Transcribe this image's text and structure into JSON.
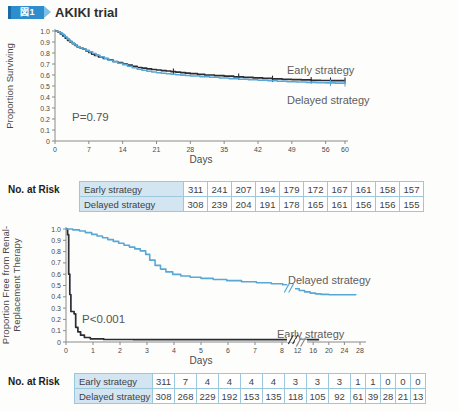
{
  "header": {
    "figure_badge": "図1",
    "title": "AKIKI trial"
  },
  "colors": {
    "badge_blue": "#2e8ecd",
    "badge_dark_blue": "#1a69a8",
    "badge_light_blue": "#7fc0e6",
    "early_line": "#2b2c34",
    "delayed_line": "#58a8d7",
    "table_border": "#6fb0d4",
    "table_header_bg": "#d2e5f0"
  },
  "risk_tables": [
    {
      "section_label": "No. at Risk",
      "rows": [
        {
          "name": "Early strategy",
          "values": [
            "311",
            "241",
            "207",
            "194",
            "179",
            "172",
            "167",
            "161",
            "158",
            "157"
          ]
        },
        {
          "name": "Delayed strategy",
          "values": [
            "308",
            "239",
            "204",
            "191",
            "178",
            "165",
            "161",
            "156",
            "156",
            "155"
          ]
        }
      ]
    },
    {
      "section_label": "No. at Risk",
      "rows": [
        {
          "name": "Early strategy",
          "values": [
            "311",
            "7",
            "4",
            "4",
            "4",
            "4",
            "3",
            "3",
            "3",
            "1",
            "1",
            "0",
            "0",
            "0"
          ]
        },
        {
          "name": "Delayed strategy",
          "values": [
            "308",
            "268",
            "229",
            "192",
            "153",
            "135",
            "118",
            "105",
            "92",
            "61",
            "39",
            "28",
            "21",
            "13"
          ]
        }
      ]
    }
  ],
  "chart_data": [
    {
      "type": "line",
      "subtype": "kaplan-meier",
      "title": "",
      "ylabel": "Proportion Surviving",
      "xlabel": "Days",
      "annotation": "P=0.79",
      "xlim": [
        0,
        60
      ],
      "ylim": [
        0,
        1
      ],
      "grid": false,
      "x_ticks": [
        {
          "label": "0",
          "day": 0
        },
        {
          "label": "7",
          "day": 7
        },
        {
          "label": "14",
          "day": 14
        },
        {
          "label": "21",
          "day": 21
        },
        {
          "label": "28",
          "day": 28
        },
        {
          "label": "35",
          "day": 35
        },
        {
          "label": "42",
          "day": 42
        },
        {
          "label": "49",
          "day": 49
        },
        {
          "label": "56",
          "day": 56
        },
        {
          "label": "60",
          "day": 60
        }
      ],
      "y_ticks": [
        {
          "label": "1.0",
          "value": 1.0
        },
        {
          "label": "0.9",
          "value": 0.9
        },
        {
          "label": "0.8",
          "value": 0.8
        },
        {
          "label": "0.7",
          "value": 0.7
        },
        {
          "label": "0.6",
          "value": 0.6
        },
        {
          "label": "0.5",
          "value": 0.5
        },
        {
          "label": "0.4",
          "value": 0.4
        },
        {
          "label": "0.3",
          "value": 0.3
        },
        {
          "label": "0.2",
          "value": 0.2
        },
        {
          "label": "0.1",
          "value": 0.1
        },
        {
          "label": "0",
          "value": 0
        }
      ],
      "series": [
        {
          "name": "Early strategy",
          "color": "#2b2c34",
          "censor_days": [
            24.5,
            38,
            45,
            53,
            57,
            60
          ],
          "points": [
            [
              0,
              1.0
            ],
            [
              0.6,
              0.99
            ],
            [
              1.1,
              0.975
            ],
            [
              1.6,
              0.955
            ],
            [
              2.1,
              0.935
            ],
            [
              2.6,
              0.915
            ],
            [
              3.1,
              0.9
            ],
            [
              3.6,
              0.885
            ],
            [
              4.1,
              0.87
            ],
            [
              4.6,
              0.855
            ],
            [
              5.2,
              0.845
            ],
            [
              5.8,
              0.835
            ],
            [
              6.4,
              0.82
            ],
            [
              7,
              0.805
            ],
            [
              7.6,
              0.79
            ],
            [
              8.2,
              0.778
            ],
            [
              9,
              0.765
            ],
            [
              10,
              0.75
            ],
            [
              11,
              0.737
            ],
            [
              12,
              0.723
            ],
            [
              13,
              0.712
            ],
            [
              14,
              0.7
            ],
            [
              15,
              0.69
            ],
            [
              16,
              0.678
            ],
            [
              17,
              0.668
            ],
            [
              18,
              0.662
            ],
            [
              19,
              0.656
            ],
            [
              20,
              0.65
            ],
            [
              21,
              0.645
            ],
            [
              22,
              0.64
            ],
            [
              23,
              0.636
            ],
            [
              24,
              0.631
            ],
            [
              25,
              0.626
            ],
            [
              26,
              0.621
            ],
            [
              27,
              0.616
            ],
            [
              28,
              0.612
            ],
            [
              29.5,
              0.606
            ],
            [
              31,
              0.6
            ],
            [
              33,
              0.594
            ],
            [
              35,
              0.589
            ],
            [
              37,
              0.584
            ],
            [
              39,
              0.579
            ],
            [
              41,
              0.574
            ],
            [
              43,
              0.569
            ],
            [
              45,
              0.565
            ],
            [
              47,
              0.561
            ],
            [
              49,
              0.558
            ],
            [
              51,
              0.555
            ],
            [
              53,
              0.552
            ],
            [
              55,
              0.55
            ],
            [
              57,
              0.549
            ],
            [
              60,
              0.548
            ]
          ]
        },
        {
          "name": "Delayed strategy",
          "color": "#58a8d7",
          "censor_days": [
            57,
            60
          ],
          "points": [
            [
              0,
              1.0
            ],
            [
              0.5,
              0.993
            ],
            [
              1,
              0.983
            ],
            [
              1.5,
              0.968
            ],
            [
              2,
              0.948
            ],
            [
              2.5,
              0.928
            ],
            [
              3,
              0.908
            ],
            [
              3.5,
              0.89
            ],
            [
              4,
              0.873
            ],
            [
              4.5,
              0.858
            ],
            [
              5,
              0.847
            ],
            [
              5.7,
              0.836
            ],
            [
              6.4,
              0.824
            ],
            [
              7.1,
              0.81
            ],
            [
              7.8,
              0.795
            ],
            [
              8.5,
              0.78
            ],
            [
              9.3,
              0.765
            ],
            [
              10.2,
              0.75
            ],
            [
              11.1,
              0.735
            ],
            [
              12,
              0.72
            ],
            [
              13,
              0.707
            ],
            [
              14,
              0.694
            ],
            [
              15,
              0.68
            ],
            [
              16,
              0.666
            ],
            [
              17,
              0.653
            ],
            [
              18,
              0.643
            ],
            [
              19,
              0.634
            ],
            [
              20,
              0.627
            ],
            [
              21,
              0.621
            ],
            [
              22,
              0.616
            ],
            [
              23,
              0.611
            ],
            [
              24,
              0.607
            ],
            [
              25,
              0.603
            ],
            [
              26,
              0.599
            ],
            [
              27,
              0.595
            ],
            [
              28,
              0.591
            ],
            [
              30,
              0.585
            ],
            [
              32,
              0.579
            ],
            [
              34,
              0.573
            ],
            [
              36,
              0.567
            ],
            [
              38,
              0.562
            ],
            [
              40,
              0.557
            ],
            [
              42,
              0.552
            ],
            [
              44,
              0.547
            ],
            [
              46,
              0.543
            ],
            [
              48,
              0.539
            ],
            [
              50,
              0.536
            ],
            [
              52,
              0.533
            ],
            [
              54,
              0.53
            ],
            [
              56,
              0.528
            ],
            [
              58,
              0.526
            ],
            [
              60,
              0.524
            ]
          ]
        }
      ]
    },
    {
      "type": "line",
      "subtype": "kaplan-meier",
      "title": "",
      "ylabel": [
        "Proportion Free from Renal-",
        "Replacement Therapy"
      ],
      "xlabel": "Days",
      "annotation": "P<0.001",
      "xlim": [
        0,
        28
      ],
      "ylim": [
        0,
        1
      ],
      "grid": false,
      "x_axis_break": {
        "between": [
          8,
          12
        ]
      },
      "x_ticks": [
        {
          "label": "0",
          "day": 0
        },
        {
          "label": "1",
          "day": 1
        },
        {
          "label": "2",
          "day": 2
        },
        {
          "label": "3",
          "day": 3
        },
        {
          "label": "4",
          "day": 4
        },
        {
          "label": "5",
          "day": 5
        },
        {
          "label": "6",
          "day": 6
        },
        {
          "label": "7",
          "day": 7
        },
        {
          "label": "8",
          "day": 8
        },
        {
          "label": "12",
          "day": 12
        },
        {
          "label": "16",
          "day": 16
        },
        {
          "label": "20",
          "day": 20
        },
        {
          "label": "24",
          "day": 24
        },
        {
          "label": "28",
          "day": 28
        }
      ],
      "y_ticks": [
        {
          "label": "1.0",
          "value": 1.0
        },
        {
          "label": "0.9",
          "value": 0.9
        },
        {
          "label": "0.8",
          "value": 0.8
        },
        {
          "label": "0.7",
          "value": 0.7
        },
        {
          "label": "0.6",
          "value": 0.6
        },
        {
          "label": "0.5",
          "value": 0.5
        },
        {
          "label": "0.4",
          "value": 0.4
        },
        {
          "label": "0.3",
          "value": 0.3
        },
        {
          "label": "0.2",
          "value": 0.2
        },
        {
          "label": "0.1",
          "value": 0.1
        },
        {
          "label": "0",
          "value": 0
        }
      ],
      "series": [
        {
          "name": "Early strategy",
          "color": "#2b2c34",
          "censor_days": [],
          "points": [
            [
              0,
              1.0
            ],
            [
              0.06,
              0.95
            ],
            [
              0.1,
              0.6
            ],
            [
              0.14,
              0.42
            ],
            [
              0.18,
              0.27
            ],
            [
              0.3,
              0.25
            ],
            [
              0.36,
              0.13
            ],
            [
              0.44,
              0.09
            ],
            [
              0.54,
              0.06
            ],
            [
              0.68,
              0.04
            ],
            [
              0.9,
              0.028
            ],
            [
              1.4,
              0.022
            ],
            [
              2.5,
              0.02
            ],
            [
              17.5,
              0.02
            ]
          ]
        },
        {
          "name": "Delayed strategy",
          "color": "#58a8d7",
          "censor_days": [],
          "points": [
            [
              0,
              1.0
            ],
            [
              0.25,
              0.992
            ],
            [
              0.5,
              0.982
            ],
            [
              0.72,
              0.968
            ],
            [
              0.95,
              0.952
            ],
            [
              1.15,
              0.938
            ],
            [
              1.35,
              0.922
            ],
            [
              1.55,
              0.906
            ],
            [
              1.75,
              0.89
            ],
            [
              1.95,
              0.874
            ],
            [
              2.15,
              0.856
            ],
            [
              2.35,
              0.84
            ],
            [
              2.55,
              0.824
            ],
            [
              2.75,
              0.806
            ],
            [
              2.95,
              0.775
            ],
            [
              3.1,
              0.725
            ],
            [
              3.3,
              0.678
            ],
            [
              3.5,
              0.645
            ],
            [
              3.7,
              0.62
            ],
            [
              3.95,
              0.598
            ],
            [
              4.25,
              0.584
            ],
            [
              4.6,
              0.573
            ],
            [
              5,
              0.563
            ],
            [
              5.45,
              0.553
            ],
            [
              5.95,
              0.543
            ],
            [
              6.5,
              0.534
            ],
            [
              7.05,
              0.525
            ],
            [
              7.6,
              0.516
            ],
            [
              8.2,
              0.505
            ],
            [
              9.2,
              0.49
            ],
            [
              10.8,
              0.472
            ],
            [
              12.4,
              0.456
            ],
            [
              13.8,
              0.443
            ],
            [
              15.2,
              0.433
            ],
            [
              16.6,
              0.426
            ],
            [
              18,
              0.421
            ],
            [
              20,
              0.419
            ],
            [
              27,
              0.418
            ]
          ]
        }
      ]
    }
  ]
}
